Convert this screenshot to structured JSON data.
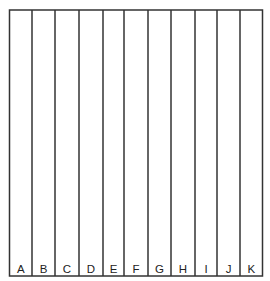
{
  "diagram": {
    "type": "partitioned-square",
    "line_color": "#333333",
    "background_color": "#ffffff",
    "box": {
      "left": 9.5,
      "top": 10,
      "right": 262.5,
      "bottom": 276
    },
    "divider_x": [
      32,
      55,
      79,
      103,
      124,
      148,
      171,
      195,
      217,
      240
    ],
    "label_y": 273,
    "strips": [
      {
        "label": "A"
      },
      {
        "label": "B"
      },
      {
        "label": "C"
      },
      {
        "label": "D"
      },
      {
        "label": "E"
      },
      {
        "label": "F"
      },
      {
        "label": "G"
      },
      {
        "label": "H"
      },
      {
        "label": "I"
      },
      {
        "label": "J"
      },
      {
        "label": "K"
      }
    ]
  }
}
